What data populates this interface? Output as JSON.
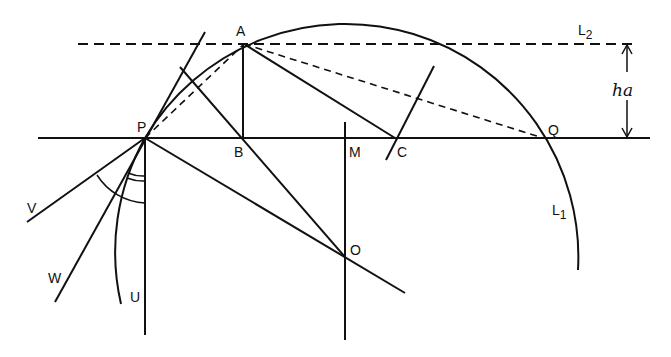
{
  "diagram": {
    "labels": {
      "A": "A",
      "B": "B",
      "C": "C",
      "M": "M",
      "O": "O",
      "P": "P",
      "Q": "Q",
      "U": "U",
      "V": "V",
      "W": "W",
      "L1": "L",
      "L1_sub": "1",
      "L2": "L",
      "L2_sub": "2",
      "ha": "ha"
    },
    "points": {
      "A": [
        244,
        44
      ],
      "B": [
        242,
        138
      ],
      "C": [
        395,
        138
      ],
      "M": [
        345,
        138
      ],
      "O": [
        345,
        257
      ],
      "P": [
        145,
        138
      ],
      "Q": [
        543,
        138
      ]
    },
    "colors": {
      "ink": "#111111",
      "background": "#ffffff"
    }
  }
}
